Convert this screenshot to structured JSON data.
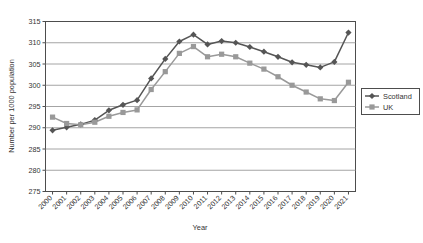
{
  "chart_data": {
    "type": "line",
    "title": "",
    "xlabel": "Year",
    "ylabel": "Number per 1000 population",
    "categories": [
      "2000",
      "2001",
      "2002",
      "2003",
      "2004",
      "2005",
      "2006",
      "2007",
      "2008",
      "2009",
      "2010",
      "2011",
      "2012",
      "2013",
      "2014",
      "2015",
      "2016",
      "2017",
      "2018",
      "2019",
      "2020",
      "2021"
    ],
    "ylim": [
      275,
      315
    ],
    "yticks": [
      275,
      280,
      285,
      290,
      295,
      300,
      305,
      310,
      315
    ],
    "grid": "horizontal",
    "legend_position": "right",
    "series": [
      {
        "name": "Scotland",
        "color": "#555555",
        "marker": "diamond",
        "values": [
          289.4,
          290.1,
          290.8,
          291.8,
          294.1,
          295.4,
          296.5,
          301.6,
          306.2,
          310.3,
          311.9,
          309.6,
          310.4,
          310.0,
          309.0,
          307.9,
          306.7,
          305.4,
          304.8,
          304.2,
          305.5,
          312.4
        ]
      },
      {
        "name": "UK",
        "color": "#999999",
        "marker": "square",
        "values": [
          292.5,
          291.0,
          290.7,
          291.3,
          292.7,
          293.6,
          294.2,
          299.0,
          303.2,
          307.5,
          309.1,
          306.7,
          307.3,
          306.7,
          305.2,
          303.8,
          302.0,
          300.0,
          298.4,
          296.8,
          296.4,
          300.7
        ]
      }
    ]
  },
  "axes": {
    "y_title": "Number per 1000 population",
    "x_title": "Year"
  },
  "legend": {
    "items": [
      {
        "label": "Scotland"
      },
      {
        "label": "UK"
      }
    ]
  },
  "colors": {
    "scotland": "#555555",
    "uk": "#999999",
    "grid": "#9a9a9a",
    "axis": "#4d4d4d",
    "text": "#333333",
    "background": "#ffffff"
  }
}
